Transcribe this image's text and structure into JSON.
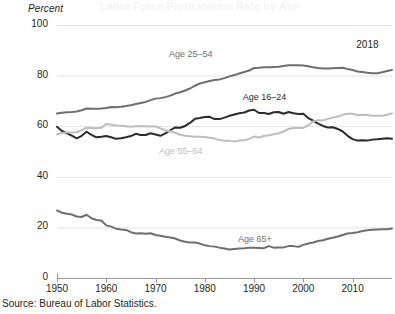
{
  "figure": {
    "ghost_title": "Labor Force Participation Rate by Age",
    "source": "Source: Bureau of Labor Statistics.",
    "year_note": "2018",
    "y_axis_title": "Percent"
  },
  "chart_data": {
    "type": "line",
    "title": "",
    "xlabel": "",
    "ylabel": "Percent",
    "xlim": [
      1950,
      2018
    ],
    "ylim": [
      0,
      100
    ],
    "grid": "horizontal",
    "legend_position": "inline-labels",
    "y_ticks": [
      0,
      20,
      40,
      60,
      80,
      100
    ],
    "y_tick_labels": [
      "0",
      "20",
      "40",
      "60",
      "80",
      "100"
    ],
    "x_ticks": [
      1950,
      1960,
      1970,
      1980,
      1990,
      2000,
      2010
    ],
    "x_tick_labels": [
      "1950",
      "1960",
      "1970",
      "1980",
      "1990",
      "2000",
      "2010"
    ],
    "annotations": [
      {
        "text": "2018",
        "x": 2014,
        "y": 92
      }
    ],
    "x": [
      1950,
      1951,
      1952,
      1953,
      1954,
      1955,
      1956,
      1957,
      1958,
      1959,
      1960,
      1961,
      1962,
      1963,
      1964,
      1965,
      1966,
      1967,
      1968,
      1969,
      1970,
      1971,
      1972,
      1973,
      1974,
      1975,
      1976,
      1977,
      1978,
      1979,
      1980,
      1981,
      1982,
      1983,
      1984,
      1985,
      1986,
      1987,
      1988,
      1989,
      1990,
      1991,
      1992,
      1993,
      1994,
      1995,
      1996,
      1997,
      1998,
      1999,
      2000,
      2001,
      2002,
      2003,
      2004,
      2005,
      2006,
      2007,
      2008,
      2009,
      2010,
      2011,
      2012,
      2013,
      2014,
      2015,
      2016,
      2017,
      2018
    ],
    "series": [
      {
        "name": "Age 25-54",
        "label": "Age 25–54",
        "color": "#6e6e6e",
        "label_x": 1978,
        "label_y": 88,
        "values": [
          65.0,
          65.3,
          65.5,
          65.6,
          65.8,
          66.3,
          67.0,
          66.9,
          66.9,
          67.0,
          67.2,
          67.6,
          67.5,
          67.7,
          68.0,
          68.3,
          68.8,
          69.2,
          69.6,
          70.3,
          70.9,
          71.1,
          71.5,
          72.1,
          72.9,
          73.4,
          74.1,
          74.9,
          76.0,
          76.9,
          77.4,
          77.9,
          78.3,
          78.5,
          79.0,
          79.7,
          80.2,
          80.8,
          81.4,
          82.0,
          83.0,
          83.1,
          83.3,
          83.3,
          83.4,
          83.5,
          83.8,
          84.1,
          84.1,
          84.1,
          84.0,
          83.7,
          83.3,
          83.0,
          82.8,
          82.8,
          82.9,
          83.0,
          83.1,
          82.6,
          82.2,
          81.6,
          81.4,
          81.1,
          80.9,
          80.9,
          81.3,
          81.8,
          82.2
        ]
      },
      {
        "name": "Age 16-24",
        "label": "Age 16–24",
        "color": "#2b2b2b",
        "label_x": 1993,
        "label_y": 71,
        "values": [
          59.8,
          58.1,
          57.2,
          56.3,
          55.2,
          56.2,
          57.8,
          56.6,
          55.6,
          55.8,
          56.1,
          55.6,
          55.0,
          55.2,
          55.6,
          56.1,
          57.0,
          56.5,
          56.5,
          57.2,
          56.7,
          56.2,
          57.2,
          58.4,
          59.5,
          59.4,
          60.1,
          61.3,
          62.9,
          63.2,
          63.6,
          63.7,
          62.8,
          62.8,
          63.4,
          64.1,
          64.6,
          65.1,
          65.4,
          66.2,
          66.5,
          65.2,
          65.2,
          64.8,
          65.5,
          65.6,
          64.9,
          65.6,
          65.1,
          64.8,
          64.9,
          63.2,
          62.2,
          61.0,
          60.1,
          59.5,
          59.6,
          58.9,
          57.9,
          56.2,
          54.9,
          54.3,
          54.4,
          54.3,
          54.7,
          54.8,
          55.0,
          55.2,
          55.0
        ]
      },
      {
        "name": "Age 55-64",
        "label": "Age 55–64",
        "color": "#bdbdbd",
        "label_x": 1976,
        "label_y": 50,
        "values": [
          56.7,
          57.3,
          57.5,
          57.5,
          57.6,
          58.4,
          59.4,
          59.3,
          59.2,
          59.4,
          60.9,
          60.6,
          60.3,
          60.2,
          60.0,
          59.8,
          60.0,
          60.1,
          60.0,
          59.9,
          59.9,
          59.1,
          58.4,
          57.9,
          57.4,
          56.6,
          56.2,
          56.0,
          55.8,
          55.8,
          55.7,
          55.4,
          55.1,
          54.5,
          54.2,
          54.2,
          54.0,
          54.3,
          54.4,
          55.0,
          55.9,
          55.5,
          56.1,
          56.4,
          56.8,
          57.2,
          57.9,
          58.9,
          59.3,
          59.3,
          59.3,
          60.4,
          61.9,
          62.4,
          62.3,
          62.9,
          63.4,
          63.8,
          64.5,
          64.9,
          64.9,
          64.3,
          64.5,
          64.4,
          64.1,
          64.1,
          64.1,
          64.5,
          65.0
        ]
      },
      {
        "name": "Age 65+",
        "label": "Age 65+",
        "color": "#6e6e6e",
        "label_x": 1992,
        "label_y": 15,
        "values": [
          26.7,
          25.8,
          25.4,
          25.1,
          24.3,
          24.1,
          25.0,
          23.6,
          22.9,
          22.7,
          20.8,
          20.3,
          19.5,
          19.2,
          19.0,
          18.1,
          17.6,
          17.7,
          17.5,
          17.7,
          17.0,
          16.7,
          16.3,
          16.0,
          15.6,
          14.8,
          14.3,
          14.0,
          14.0,
          13.6,
          12.9,
          12.6,
          12.4,
          12.0,
          11.7,
          11.3,
          11.5,
          11.7,
          11.8,
          12.0,
          12.0,
          11.9,
          11.8,
          12.6,
          12.0,
          12.1,
          12.1,
          12.6,
          12.6,
          12.3,
          13.1,
          13.6,
          14.0,
          14.6,
          14.9,
          15.5,
          15.9,
          16.4,
          17.0,
          17.6,
          17.8,
          18.1,
          18.6,
          18.9,
          19.1,
          19.2,
          19.3,
          19.3,
          19.6
        ]
      }
    ]
  }
}
